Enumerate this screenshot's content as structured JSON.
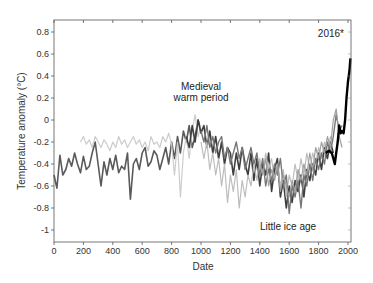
{
  "chart_data": {
    "type": "line",
    "title": "",
    "xlabel": "Date",
    "ylabel": "Temperature anomaly (°C)",
    "xlim": [
      0,
      2000
    ],
    "ylim": [
      -1.1,
      0.9
    ],
    "xticks": [
      0,
      200,
      400,
      600,
      800,
      1000,
      1200,
      1400,
      1600,
      1800,
      2000
    ],
    "yticks": [
      0.8,
      0.6,
      0.4,
      0.2,
      0,
      -0.2,
      -0.4,
      -0.6,
      -0.8,
      -1
    ],
    "ytick_labels": [
      "0.8",
      "0.6",
      "0.4",
      "0.2",
      "0",
      "-0.2",
      "-0.4",
      "-0.6",
      "-0.8",
      "-1"
    ],
    "grid": false,
    "legend": null,
    "annotations": [
      {
        "text": "Medieval",
        "x": 1000,
        "y": 0.27
      },
      {
        "text": "warm period",
        "x": 1000,
        "y": 0.17
      },
      {
        "text": "Little ice age",
        "x": 1700,
        "y": -0.96
      },
      {
        "text": "2016*",
        "x": 1910,
        "y": 0.78
      }
    ],
    "series": [
      {
        "name": "reconstruction-1",
        "color": "#5a5a5a",
        "width": 1.6,
        "x": [
          0,
          20,
          40,
          60,
          80,
          100,
          120,
          140,
          160,
          180,
          200,
          220,
          240,
          260,
          280,
          300,
          320,
          340,
          360,
          380,
          400,
          420,
          440,
          460,
          480,
          500,
          520,
          540,
          560,
          580,
          600,
          620,
          640,
          660,
          680,
          700,
          720,
          740,
          760,
          780,
          800,
          820,
          840,
          860,
          880,
          900,
          920,
          940,
          960,
          980,
          1000
        ],
        "y": [
          -0.5,
          -0.62,
          -0.32,
          -0.5,
          -0.45,
          -0.35,
          -0.42,
          -0.3,
          -0.4,
          -0.48,
          -0.33,
          -0.45,
          -0.42,
          -0.3,
          -0.2,
          -0.4,
          -0.6,
          -0.38,
          -0.5,
          -0.35,
          -0.45,
          -0.32,
          -0.48,
          -0.42,
          -0.45,
          -0.3,
          -0.72,
          -0.4,
          -0.35,
          -0.45,
          -0.3,
          -0.25,
          -0.42,
          -0.38,
          -0.28,
          -0.32,
          -0.45,
          -0.35,
          -0.25,
          -0.4,
          -0.2,
          -0.35,
          -0.15,
          -0.3,
          -0.1,
          -0.2,
          -0.05,
          -0.25,
          -0.15,
          0.0,
          -0.1
        ]
      },
      {
        "name": "reconstruction-2",
        "color": "#cccccc",
        "width": 1.2,
        "x": [
          180,
          200,
          220,
          240,
          260,
          280,
          300,
          320,
          340,
          360,
          380,
          400,
          420,
          440,
          460,
          480,
          500,
          520,
          540,
          560,
          580,
          600,
          620,
          640,
          660,
          680,
          700,
          720,
          740,
          760,
          780,
          800,
          820,
          840,
          860,
          880,
          900,
          920,
          940,
          960,
          980,
          1000
        ],
        "y": [
          -0.2,
          -0.15,
          -0.22,
          -0.18,
          -0.25,
          -0.15,
          -0.2,
          -0.25,
          -0.18,
          -0.22,
          -0.28,
          -0.2,
          -0.25,
          -0.15,
          -0.22,
          -0.18,
          -0.25,
          -0.2,
          -0.15,
          -0.22,
          -0.18,
          -0.25,
          -0.2,
          -0.28,
          -0.15,
          -0.22,
          -0.2,
          -0.25,
          -0.15,
          -0.2,
          -0.12,
          -0.22,
          -0.5,
          -0.2,
          -0.7,
          -0.3,
          -0.15,
          -0.35,
          -0.1,
          0.05,
          -0.15,
          -0.05
        ]
      },
      {
        "name": "reconstruction-3",
        "color": "#3e3e3e",
        "width": 1.6,
        "x": [
          900,
          920,
          940,
          960,
          980,
          1000,
          1020,
          1040,
          1060,
          1080,
          1100,
          1120,
          1140,
          1160,
          1180,
          1200,
          1220,
          1240,
          1260,
          1280,
          1300,
          1320,
          1340,
          1360,
          1380,
          1400,
          1420,
          1440,
          1460,
          1480,
          1500,
          1520,
          1540,
          1560,
          1580,
          1600,
          1620,
          1640,
          1660,
          1680,
          1700,
          1720,
          1740,
          1760,
          1780,
          1800,
          1820,
          1840,
          1860,
          1880,
          1900
        ],
        "y": [
          -0.15,
          -0.25,
          -0.05,
          -0.2,
          0.0,
          -0.12,
          -0.05,
          -0.25,
          -0.1,
          -0.3,
          -0.15,
          -0.35,
          -0.2,
          -0.4,
          -0.25,
          -0.3,
          -0.5,
          -0.3,
          -0.45,
          -0.25,
          -0.4,
          -0.5,
          -0.3,
          -0.55,
          -0.35,
          -0.6,
          -0.4,
          -0.5,
          -0.3,
          -0.65,
          -0.45,
          -0.35,
          -0.7,
          -0.55,
          -0.8,
          -0.6,
          -0.75,
          -0.55,
          -0.65,
          -0.5,
          -0.7,
          -0.45,
          -0.55,
          -0.4,
          -0.5,
          -0.3,
          -0.45,
          -0.25,
          -0.35,
          -0.2,
          -0.3
        ]
      },
      {
        "name": "reconstruction-4",
        "color": "#bdbdbd",
        "width": 1.2,
        "x": [
          1000,
          1020,
          1040,
          1060,
          1080,
          1100,
          1120,
          1140,
          1160,
          1180,
          1200,
          1220,
          1240,
          1260,
          1280,
          1300,
          1320,
          1340,
          1360,
          1380,
          1400,
          1420,
          1440,
          1460,
          1480,
          1500,
          1520,
          1540,
          1560,
          1580,
          1600,
          1620,
          1640,
          1660,
          1680,
          1700,
          1720,
          1740,
          1760,
          1780,
          1800,
          1820,
          1840,
          1860,
          1880,
          1900
        ],
        "y": [
          -0.2,
          -0.35,
          -0.2,
          -0.45,
          -0.3,
          -0.5,
          -0.35,
          -0.6,
          -0.4,
          -0.75,
          -0.5,
          -0.65,
          -0.45,
          -0.8,
          -0.55,
          -0.7,
          -0.5,
          -0.6,
          -0.4,
          -0.55,
          -0.35,
          -0.5,
          -0.3,
          -0.45,
          -0.35,
          -0.55,
          -0.4,
          -0.6,
          -0.45,
          -0.7,
          -0.5,
          -0.6,
          -0.4,
          -0.55,
          -0.35,
          -0.5,
          -0.3,
          -0.45,
          -0.3,
          -0.4,
          -0.25,
          -0.35,
          -0.2,
          -0.3,
          -0.15,
          -0.2
        ]
      },
      {
        "name": "reconstruction-5",
        "color": "#777777",
        "width": 1.4,
        "x": [
          1000,
          1020,
          1040,
          1060,
          1080,
          1100,
          1120,
          1140,
          1160,
          1180,
          1200,
          1220,
          1240,
          1260,
          1280,
          1300,
          1320,
          1340,
          1360,
          1380,
          1400,
          1420,
          1440,
          1460,
          1480,
          1500,
          1520,
          1540,
          1560,
          1580,
          1600,
          1620,
          1640,
          1660,
          1680,
          1700,
          1720,
          1740,
          1760,
          1780,
          1800,
          1820,
          1840,
          1860,
          1880,
          1900,
          1920,
          1940,
          1960
        ],
        "y": [
          -0.1,
          -0.2,
          -0.05,
          -0.25,
          -0.15,
          -0.3,
          -0.2,
          -0.15,
          -0.35,
          -0.25,
          -0.4,
          -0.3,
          -0.2,
          -0.35,
          -0.25,
          -0.45,
          -0.35,
          -0.25,
          -0.4,
          -0.3,
          -0.5,
          -0.35,
          -0.6,
          -0.45,
          -0.55,
          -0.4,
          -0.5,
          -0.35,
          -0.6,
          -0.5,
          -0.85,
          -0.6,
          -0.7,
          -0.55,
          -0.8,
          -0.5,
          -0.6,
          -0.4,
          -0.55,
          -0.35,
          -0.45,
          -0.3,
          -0.4,
          -0.2,
          -0.3,
          -0.15,
          0.05,
          -0.1,
          -0.05
        ]
      },
      {
        "name": "reconstruction-6",
        "color": "#a0a0a0",
        "width": 1.2,
        "x": [
          1400,
          1420,
          1440,
          1460,
          1480,
          1500,
          1520,
          1540,
          1560,
          1580,
          1600,
          1620,
          1640,
          1660,
          1680,
          1700,
          1720,
          1740,
          1760,
          1780,
          1800,
          1820,
          1840,
          1860,
          1880,
          1900,
          1920,
          1940,
          1960
        ],
        "y": [
          -0.4,
          -0.5,
          -0.35,
          -0.6,
          -0.45,
          -0.55,
          -0.4,
          -0.65,
          -0.5,
          -0.6,
          -0.7,
          -0.55,
          -0.65,
          -0.45,
          -0.55,
          -0.4,
          -0.5,
          -0.3,
          -0.45,
          -0.25,
          -0.35,
          -0.2,
          -0.3,
          -0.15,
          -0.25,
          0.0,
          0.1,
          -0.15,
          -0.25
        ]
      },
      {
        "name": "instrumental",
        "color": "#000000",
        "width": 2.4,
        "x": [
          1850,
          1870,
          1890,
          1910,
          1920,
          1930,
          1940,
          1950,
          1960,
          1970,
          1980,
          1990,
          2000,
          2010,
          2016
        ],
        "y": [
          -0.3,
          -0.28,
          -0.3,
          -0.4,
          -0.3,
          -0.2,
          -0.05,
          -0.12,
          -0.1,
          -0.12,
          0.0,
          0.2,
          0.35,
          0.45,
          0.56
        ]
      }
    ]
  }
}
